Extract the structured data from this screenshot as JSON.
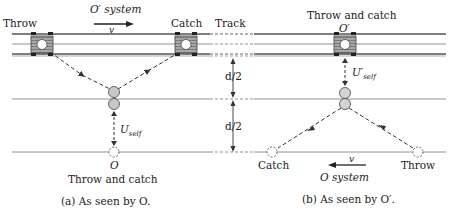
{
  "panel_a": {
    "throw_label": "Throw",
    "catch_label": "Catch",
    "system_label": "O′ system",
    "velocity_label": "v",
    "speed_label_main": "U",
    "speed_label_sub": "self",
    "observer_label": "O",
    "event_label": "Throw and catch",
    "caption": "(a) As seen by O."
  },
  "middle": {
    "track_label": "Track",
    "half_distance_top": "d/2",
    "half_distance_bottom": "d/2"
  },
  "panel_b": {
    "event_label": "Throw and catch",
    "observer_label": "O′",
    "speed_label_main": "U′",
    "speed_label_sub": "self",
    "catch_label": "Catch",
    "throw_label": "Throw",
    "velocity_label": "v",
    "system_label": "O system",
    "caption": "(b) As seen by O′."
  },
  "colors": {
    "line": "#555555",
    "cart_fill": "#9a9a9a",
    "ball_fill": "#c8c8c8",
    "wheel": "#222222"
  }
}
